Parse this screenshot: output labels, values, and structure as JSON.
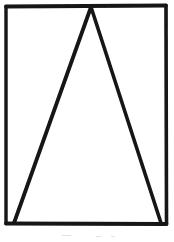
{
  "image": {
    "kind": "scanned-line-drawing",
    "title": "Rectangle with inscribed triangle",
    "width": 174,
    "height": 242,
    "background_color": "#ffffff",
    "ink_color": "#1a1a1a",
    "caption_text": ""
  },
  "figure": {
    "stroke_color": "#141414",
    "stroke_width": 3.6,
    "rectangle": {
      "name": "outer-rectangle",
      "left": 6,
      "top": 6,
      "right": 166,
      "bottom": 224,
      "width": 160,
      "height": 218
    },
    "triangle": {
      "name": "inscribed-triangle",
      "apex": {
        "x": 91,
        "y": 7
      },
      "base_left": {
        "x": 14,
        "y": 223
      },
      "base_right": {
        "x": 161,
        "y": 223
      }
    },
    "vertices_labels": [],
    "annotations": []
  },
  "artifacts": {
    "smudge_a": "",
    "smudge_b": "",
    "smudge_c": ""
  }
}
